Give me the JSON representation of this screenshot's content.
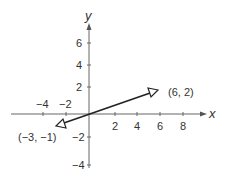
{
  "diagram": {
    "type": "coordinate-plane-vector",
    "axes": {
      "x_label": "x",
      "y_label": "y",
      "x_ticks": [
        {
          "value": -4,
          "label": "−4"
        },
        {
          "value": -2,
          "label": "−2"
        },
        {
          "value": 2,
          "label": "2"
        },
        {
          "value": 4,
          "label": "4"
        },
        {
          "value": 6,
          "label": "6"
        },
        {
          "value": 8,
          "label": "8"
        }
      ],
      "y_ticks": [
        {
          "value": 6,
          "label": "6"
        },
        {
          "value": 4,
          "label": "4"
        },
        {
          "value": 2,
          "label": "2"
        },
        {
          "value": -2,
          "label": "−2"
        },
        {
          "value": -4,
          "label": "−4"
        }
      ]
    },
    "line": {
      "endpoint_a": {
        "x": 6,
        "y": 2,
        "label": "(6, 2)"
      },
      "endpoint_b": {
        "x": -3,
        "y": -1,
        "label": "(−3, −1)"
      },
      "arrowheads": "open-triangle-both-ends"
    },
    "colors": {
      "axis": "#555555",
      "line": "#222222",
      "text": "#333333"
    }
  }
}
